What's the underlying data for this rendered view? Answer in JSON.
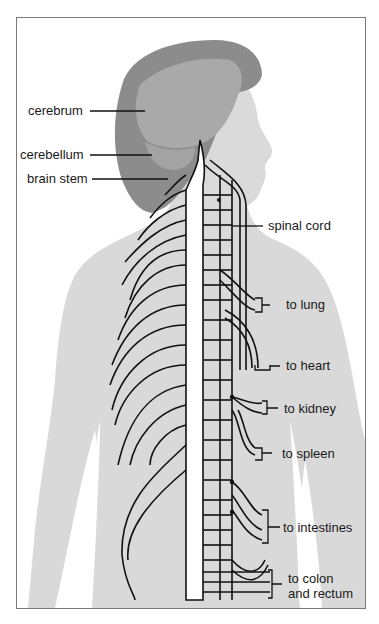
{
  "diagram": {
    "colors": {
      "background": "#ffffff",
      "body_silhouette": "#d9d9d9",
      "hair": "#8c8c8c",
      "brain": "#a9a9a9",
      "face": "#dadada",
      "nerve_lines": "#111111",
      "frame_border": "#7a7a7a",
      "text": "#1a1a1a"
    },
    "labels": {
      "cerebrum": "cerebrum",
      "cerebellum": "cerebellum",
      "brain_stem": "brain stem",
      "spinal_cord": "spinal cord",
      "to_lung": "to lung",
      "to_heart": "to heart",
      "to_kidney": "to kidney",
      "to_spleen": "to spleen",
      "to_intestines": "to intestines",
      "to_colon_line1": "to colon",
      "to_colon_line2": "and rectum"
    }
  }
}
